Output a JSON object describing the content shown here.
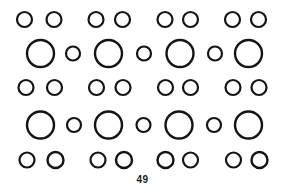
{
  "page": {
    "width": 285,
    "height": 193,
    "background_color": "#ffffff",
    "page_number": "49",
    "stroke_color": "#141414"
  },
  "figure": {
    "title": "",
    "rows": [
      {
        "name": "row-1-small-pairs",
        "cy": 19.5,
        "circles": [
          {
            "cx": 24.5,
            "r": 7.5,
            "stroke": 2.2,
            "size": "small"
          },
          {
            "cx": 54.0,
            "r": 7.5,
            "stroke": 2.2,
            "size": "small"
          },
          {
            "cx": 96.0,
            "r": 7.5,
            "stroke": 2.2,
            "size": "small"
          },
          {
            "cx": 122.5,
            "r": 7.5,
            "stroke": 2.2,
            "size": "small"
          },
          {
            "cx": 165.0,
            "r": 7.5,
            "stroke": 2.2,
            "size": "small"
          },
          {
            "cx": 190.5,
            "r": 7.5,
            "stroke": 2.2,
            "size": "small"
          },
          {
            "cx": 232.5,
            "r": 7.5,
            "stroke": 2.2,
            "size": "small"
          },
          {
            "cx": 258.5,
            "r": 7.5,
            "stroke": 2.2,
            "size": "small"
          }
        ]
      },
      {
        "name": "row-2-alternating",
        "cy": 53.5,
        "circles": [
          {
            "cx": 40.5,
            "r": 13.5,
            "stroke": 2.4,
            "size": "large"
          },
          {
            "cx": 73.0,
            "r": 7.0,
            "stroke": 2.2,
            "size": "small"
          },
          {
            "cx": 108.5,
            "r": 13.5,
            "stroke": 2.4,
            "size": "large"
          },
          {
            "cx": 144.0,
            "r": 7.0,
            "stroke": 2.2,
            "size": "small"
          },
          {
            "cx": 180.0,
            "r": 13.5,
            "stroke": 2.4,
            "size": "large"
          },
          {
            "cx": 215.0,
            "r": 7.0,
            "stroke": 2.2,
            "size": "small"
          },
          {
            "cx": 248.5,
            "r": 13.5,
            "stroke": 2.4,
            "size": "large"
          }
        ]
      },
      {
        "name": "row-3-small-pairs",
        "cy": 87.5,
        "circles": [
          {
            "cx": 26.0,
            "r": 7.5,
            "stroke": 2.2,
            "size": "small"
          },
          {
            "cx": 54.5,
            "r": 7.5,
            "stroke": 2.2,
            "size": "small"
          },
          {
            "cx": 96.5,
            "r": 7.5,
            "stroke": 2.2,
            "size": "small"
          },
          {
            "cx": 123.0,
            "r": 7.5,
            "stroke": 2.2,
            "size": "small"
          },
          {
            "cx": 165.5,
            "r": 7.5,
            "stroke": 2.2,
            "size": "small"
          },
          {
            "cx": 190.5,
            "r": 7.5,
            "stroke": 2.2,
            "size": "small"
          },
          {
            "cx": 233.0,
            "r": 7.5,
            "stroke": 2.2,
            "size": "small"
          },
          {
            "cx": 259.0,
            "r": 7.5,
            "stroke": 2.2,
            "size": "small"
          }
        ]
      },
      {
        "name": "row-4-alternating",
        "cy": 125.0,
        "circles": [
          {
            "cx": 40.5,
            "r": 13.5,
            "stroke": 2.4,
            "size": "large"
          },
          {
            "cx": 74.0,
            "r": 7.0,
            "stroke": 2.2,
            "size": "small"
          },
          {
            "cx": 108.5,
            "r": 13.5,
            "stroke": 2.4,
            "size": "large"
          },
          {
            "cx": 143.5,
            "r": 7.0,
            "stroke": 2.2,
            "size": "small"
          },
          {
            "cx": 179.0,
            "r": 13.5,
            "stroke": 2.4,
            "size": "large"
          },
          {
            "cx": 214.0,
            "r": 7.0,
            "stroke": 2.2,
            "size": "small"
          },
          {
            "cx": 248.5,
            "r": 13.5,
            "stroke": 2.4,
            "size": "large"
          }
        ]
      },
      {
        "name": "row-5-small-pairs",
        "cy": 160.0,
        "circles": [
          {
            "cx": 27.0,
            "r": 7.5,
            "stroke": 2.2,
            "size": "small"
          },
          {
            "cx": 55.5,
            "r": 8.0,
            "stroke": 2.4,
            "size": "small"
          },
          {
            "cx": 98.0,
            "r": 7.5,
            "stroke": 2.2,
            "size": "small"
          },
          {
            "cx": 124.0,
            "r": 8.0,
            "stroke": 2.4,
            "size": "small"
          },
          {
            "cx": 165.5,
            "r": 8.0,
            "stroke": 2.4,
            "size": "small"
          },
          {
            "cx": 190.5,
            "r": 7.5,
            "stroke": 2.2,
            "size": "small"
          },
          {
            "cx": 233.5,
            "r": 7.5,
            "stroke": 2.2,
            "size": "small"
          },
          {
            "cx": 259.5,
            "r": 8.0,
            "stroke": 2.4,
            "size": "small"
          }
        ]
      }
    ]
  }
}
